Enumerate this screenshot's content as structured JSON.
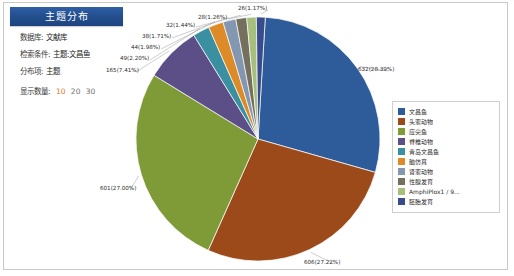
{
  "panel": {
    "title": "主题分布",
    "rows": [
      {
        "label": "数据库:",
        "value": "文献库"
      },
      {
        "label": "检索条件:",
        "value": "主题:文昌鱼"
      },
      {
        "label": "分布项:",
        "value": "主题"
      }
    ],
    "count_label": "显示数量:",
    "count_options": [
      "10",
      "20",
      "30"
    ],
    "count_selected": "10"
  },
  "legend": {
    "items": [
      {
        "label": "文昌鱼",
        "color": "#2e5b9a"
      },
      {
        "label": "头索动物",
        "color": "#9d4a1b"
      },
      {
        "label": "应尖鱼",
        "color": "#7f9b37"
      },
      {
        "label": "脊椎动物",
        "color": "#5c4e86"
      },
      {
        "label": "青岛文昌鱼",
        "color": "#3a8fa0"
      },
      {
        "label": "脑仿真",
        "color": "#dd8b28"
      },
      {
        "label": "肾索动物",
        "color": "#8497b0"
      },
      {
        "label": "性腺发育",
        "color": "#75705e"
      },
      {
        "label": "AmphiPlox1 / 9...",
        "color": "#a7bf7c"
      },
      {
        "label": "胚胎发育",
        "color": "#384c8c"
      }
    ]
  },
  "chart_data": {
    "type": "pie",
    "title": "主题分布",
    "legend_position": "right",
    "total": 2226,
    "categories": [
      "文昌鱼",
      "头索动物",
      "应尖鱼",
      "脊椎动物",
      "青岛文昌鱼",
      "脑仿真",
      "肾索动物",
      "性腺发育",
      "AmphiPlox1 / 9...",
      "胚胎发育"
    ],
    "values": [
      632,
      606,
      601,
      165,
      49,
      44,
      38,
      32,
      28,
      26
    ],
    "percents": [
      28.39,
      27.22,
      27.0,
      7.41,
      2.2,
      1.98,
      1.71,
      1.44,
      1.26,
      1.17
    ],
    "labels": [
      "632(28.39%)",
      "606(27.22%)",
      "601(27.00%)",
      "165(7.41%)",
      "49(2.20%)",
      "44(1.98%)",
      "38(1.71%)",
      "32(1.44%)",
      "28(1.26%)",
      "26(1.17%)"
    ],
    "colors": [
      "#2e5b9a",
      "#9d4a1b",
      "#7f9b37",
      "#5c4e86",
      "#3a8fa0",
      "#dd8b28",
      "#8497b0",
      "#75705e",
      "#a7bf7c",
      "#384c8c"
    ]
  }
}
